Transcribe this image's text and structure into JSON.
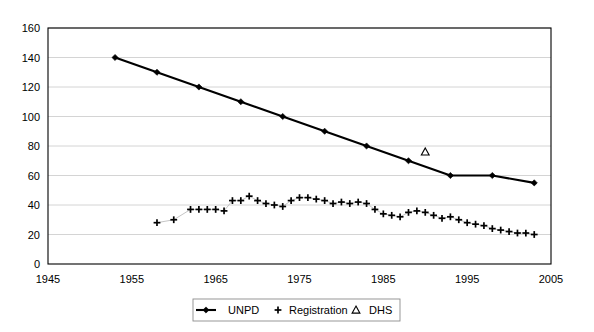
{
  "chart_data": {
    "type": "line",
    "title": "",
    "subtitle": "",
    "xlabel": "",
    "ylabel": "",
    "xlim": [
      1945,
      2005
    ],
    "ylim": [
      0,
      160
    ],
    "xticks": [
      1945,
      1955,
      1965,
      1975,
      1985,
      1995,
      2005
    ],
    "yticks": [
      0,
      20,
      40,
      60,
      80,
      100,
      120,
      140,
      160
    ],
    "grid": "horizontal",
    "legend_position": "bottom-center",
    "series": [
      {
        "name": "UNPD",
        "marker": "diamond",
        "line": true,
        "x": [
          1953,
          1958,
          1963,
          1968,
          1973,
          1978,
          1983,
          1988,
          1993,
          1998,
          2003
        ],
        "values": [
          140,
          130,
          120,
          110,
          100,
          90,
          80,
          70,
          60,
          60,
          55
        ]
      },
      {
        "name": "Registration",
        "marker": "plus",
        "line": true,
        "x": [
          1958,
          1960,
          1962,
          1963,
          1964,
          1965,
          1966,
          1967,
          1968,
          1969,
          1970,
          1971,
          1972,
          1973,
          1974,
          1975,
          1976,
          1977,
          1978,
          1979,
          1980,
          1981,
          1982,
          1983,
          1984,
          1985,
          1986,
          1987,
          1988,
          1989,
          1990,
          1991,
          1992,
          1993,
          1994,
          1995,
          1996,
          1997,
          1998,
          1999,
          2000,
          2001,
          2002,
          2003
        ],
        "values": [
          28,
          30,
          37,
          37,
          37,
          37,
          36,
          43,
          43,
          46,
          43,
          41,
          40,
          39,
          43,
          45,
          45,
          44,
          43,
          41,
          42,
          41,
          42,
          41,
          37,
          34,
          33,
          32,
          35,
          36,
          35,
          33,
          31,
          32,
          30,
          28,
          27,
          26,
          24,
          23,
          22,
          21,
          21,
          20
        ]
      },
      {
        "name": "DHS",
        "marker": "triangle",
        "line": false,
        "x": [
          1990
        ],
        "values": [
          76
        ]
      }
    ]
  },
  "legend": {
    "entries": [
      {
        "label": "UNPD",
        "symbol": "line-diamond"
      },
      {
        "label": "Registration",
        "symbol": "plus"
      },
      {
        "label": "DHS",
        "symbol": "triangle"
      }
    ]
  },
  "colors": {
    "series_unpd": "#000000",
    "series_registration": "#000000",
    "series_dhs": "#000000",
    "gridline": "#c9c9c9",
    "axis": "#000000",
    "background": "#ffffff"
  }
}
